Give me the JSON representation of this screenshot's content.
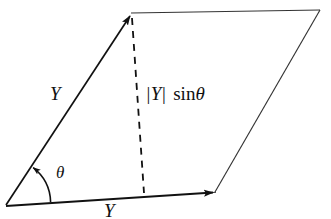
{
  "figure": {
    "type": "geometry-diagram",
    "background_color": "#ffffff",
    "stroke_color": "#1a1a1a"
  },
  "labels": {
    "vector_side": {
      "name": "Y",
      "text": "Y",
      "style": "italic"
    },
    "vector_base": {
      "name": "Y",
      "text": "Y",
      "style": "italic"
    },
    "angle": {
      "name": "theta",
      "text": "θ",
      "style": "italic"
    },
    "height": {
      "bar_open": "|",
      "magnitude": "Y",
      "bar_close": "|",
      "function": "sin",
      "argument": "θ",
      "full_text": "|Y| sin θ"
    }
  },
  "geometry": {
    "origin": {
      "x": 6,
      "y": 205
    },
    "top_left": {
      "x": 131,
      "y": 13
    },
    "top_right": {
      "x": 320,
      "y": 10
    },
    "bottom_right": {
      "x": 215,
      "y": 192
    },
    "dashed_foot": {
      "x": 144,
      "y": 194
    },
    "arc_radius": 45,
    "arrow_side_tip": {
      "x": 130,
      "y": 16
    },
    "arrow_base_tip": {
      "x": 213,
      "y": 192
    }
  }
}
